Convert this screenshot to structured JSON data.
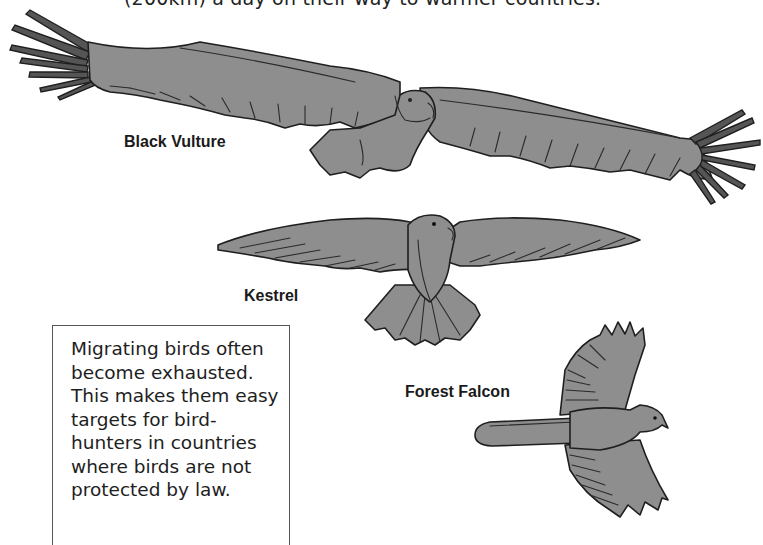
{
  "page": {
    "top_caption": "(200km) a day on their way to warmer countries."
  },
  "birds": [
    {
      "name": "black-vulture",
      "label": "Black Vulture"
    },
    {
      "name": "kestrel",
      "label": "Kestrel"
    },
    {
      "name": "forest-falcon",
      "label": "Forest Falcon"
    }
  ],
  "info_box": {
    "text": "Migrating birds often\nbecome exhausted.\nThis makes them easy\ntargets for bird-\nhunters in countries\nwhere birds are not\nprotected by law."
  },
  "colors": {
    "bird_fill": "#8e8e8e",
    "outline": "#1f1f1f",
    "text": "#1e1e1e",
    "background": "#ffffff"
  }
}
